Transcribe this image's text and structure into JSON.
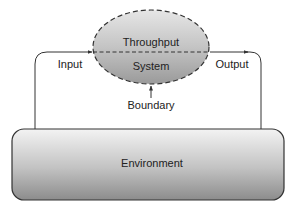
{
  "diagram": {
    "type": "systems-model",
    "labels": {
      "throughput": "Throughput",
      "system": "System",
      "input": "Input",
      "output": "Output",
      "boundary": "Boundary",
      "environment": "Environment"
    },
    "colors": {
      "stroke": "#333333",
      "ellipse_top": "#e4e4e4",
      "ellipse_bottom": "#9a9a9a",
      "env_top": "#f2f2f2",
      "env_bottom": "#8e8e8e",
      "text": "#222222"
    },
    "edges": [
      {
        "from": "environment",
        "to": "system",
        "label": "Input"
      },
      {
        "from": "system",
        "to": "environment",
        "label": "Output"
      },
      {
        "from": "boundary-label",
        "to": "system-boundary",
        "label": "Boundary"
      }
    ]
  }
}
